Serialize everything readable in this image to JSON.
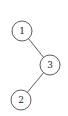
{
  "diagram": {
    "type": "tree",
    "nodes": [
      {
        "id": "1",
        "label": "1",
        "cx": 22,
        "cy": 31,
        "r": 10
      },
      {
        "id": "3",
        "label": "3",
        "cx": 50,
        "cy": 65,
        "r": 10
      },
      {
        "id": "2",
        "label": "2",
        "cx": 21,
        "cy": 100,
        "r": 10
      }
    ],
    "edges": [
      {
        "from": "1",
        "to": "3"
      },
      {
        "from": "3",
        "to": "2"
      }
    ]
  }
}
